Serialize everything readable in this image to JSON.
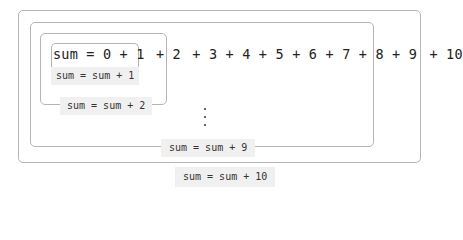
{
  "diagram": {
    "expression": {
      "parts": [
        "sum = 0 + 1",
        " + 2",
        " + 3 + 4 + 5 + 6 + 7 + 8 + 9",
        " + 10"
      ]
    },
    "labels": {
      "step1": "sum = sum + 1",
      "step2": "sum = sum + 2",
      "step9": "sum = sum + 9",
      "step10": "sum = sum + 10"
    },
    "ellipsis": "⋮"
  }
}
